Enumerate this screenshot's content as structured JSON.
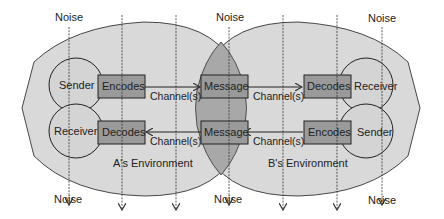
{
  "diagram": {
    "noise_label": "Noise",
    "noise_top": [
      {
        "label": "Noise",
        "x": 69
      },
      {
        "label": "Noise",
        "x": 229
      },
      {
        "label": "Noise",
        "x": 381
      }
    ],
    "noise_bottom": [
      {
        "label": "Noise",
        "x": 68
      },
      {
        "label": "Noise",
        "x": 226
      },
      {
        "label": "Noise",
        "x": 380
      }
    ],
    "left_party": {
      "top_circle": "Sender",
      "bottom_circle": "Receiver",
      "top_box": "Encodes",
      "bottom_box": "Decodes",
      "environment": "A's Environment"
    },
    "right_party": {
      "top_circle": "Receiver",
      "bottom_circle": "Sender",
      "top_box": "Decodes",
      "bottom_box": "Encodes",
      "environment": "B's Environment"
    },
    "center": {
      "top_box": "Message",
      "bottom_box": "Message"
    },
    "channel_labels": [
      "Channel(s)",
      "Channel(s)",
      "Channel(s)",
      "Channel(s)"
    ],
    "colors": {
      "environment_fill": "#d9d9d9",
      "overlap_fill": "#a8a8a8",
      "box_fill": "#9a9a9a",
      "circle_fill": "#d4d4d4",
      "stroke": "#333333"
    }
  }
}
